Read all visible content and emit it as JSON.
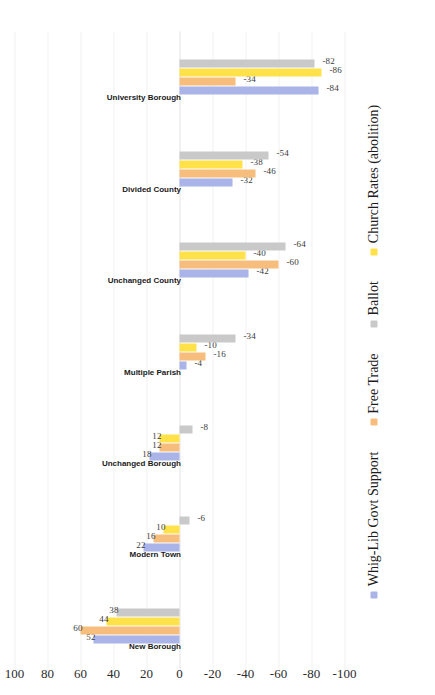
{
  "chart_data": {
    "type": "bar",
    "title": "",
    "subtitle": "",
    "xlabel": "",
    "ylabel": "",
    "orientation": "vertical-rotated-90",
    "grid": true,
    "legend_position": "bottom",
    "ylim": [
      -100,
      100
    ],
    "yticks": [
      "100",
      "80",
      "60",
      "40",
      "20",
      "0",
      "-20",
      "-40",
      "-60",
      "-80",
      "-100"
    ],
    "ytick_values": [
      100,
      80,
      60,
      40,
      20,
      0,
      -20,
      -40,
      -60,
      -80,
      -100
    ],
    "categories": [
      "New Borough",
      "Modern Town",
      "Unchanged Borough",
      "Multiple Parish",
      "Unchanged County",
      "Divided County",
      "University Borough"
    ],
    "series": [
      {
        "name": "Whig-Lib Govt Support",
        "color": "#aab4e8",
        "values": [
          52,
          22,
          18,
          -4,
          -42,
          -32,
          -84
        ]
      },
      {
        "name": "Free Trade",
        "color": "#f7bd7d",
        "values": [
          60,
          16,
          12,
          -16,
          -60,
          -46,
          -34
        ]
      },
      {
        "name": "Ballot",
        "color": "#c9c9c9",
        "values": [
          38,
          -6,
          -8,
          -34,
          -64,
          -54,
          -82
        ]
      },
      {
        "name": "Church Rates (abolition)",
        "color": "#ffe24a",
        "values": [
          44,
          10,
          12,
          -10,
          -40,
          -38,
          -86
        ]
      }
    ],
    "series_draw_order": [
      "Whig-Lib Govt Support",
      "Free Trade",
      "Church Rates (abolition)",
      "Ballot"
    ]
  },
  "legend": {
    "items": [
      {
        "label": "Whig-Lib Govt Support",
        "color": "#aab4e8",
        "swatch": "blue"
      },
      {
        "label": "Free Trade",
        "color": "#f7bd7d",
        "swatch": "orange"
      },
      {
        "label": "Ballot",
        "color": "#c9c9c9",
        "swatch": "grey"
      },
      {
        "label": "Church Rates (abolition)",
        "color": "#ffe24a",
        "swatch": "yellow"
      }
    ]
  },
  "colors": {
    "background": "#ffffff",
    "gridline": "#f2f2f2",
    "zeroline": "#e3e3e3",
    "text": "#1d1d1d",
    "value_label": "#3a3a3a"
  }
}
